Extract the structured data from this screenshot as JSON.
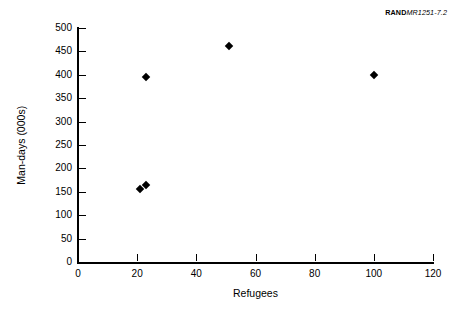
{
  "figure_id": {
    "mark": "RAND",
    "number": "MR1251-7.2"
  },
  "chart_data": {
    "type": "scatter",
    "title": "",
    "xlabel": "Refugees",
    "ylabel": "Man-days (000s)",
    "xlim": [
      0,
      120
    ],
    "ylim": [
      0,
      500
    ],
    "xticks": [
      0,
      20,
      40,
      60,
      80,
      100,
      120
    ],
    "yticks": [
      0,
      50,
      100,
      150,
      200,
      250,
      300,
      350,
      400,
      450,
      500
    ],
    "grid": false,
    "legend": null,
    "marker": "diamond",
    "marker_color": "#000000",
    "points": [
      {
        "x": 21,
        "y": 156
      },
      {
        "x": 23,
        "y": 165
      },
      {
        "x": 23,
        "y": 395
      },
      {
        "x": 51,
        "y": 462
      },
      {
        "x": 100,
        "y": 399
      }
    ]
  }
}
